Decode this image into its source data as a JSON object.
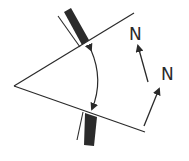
{
  "diagram": {
    "labels": {
      "north_1": "N",
      "north_2": "N"
    },
    "colors": {
      "stroke": "#2a2a2a",
      "bar_fill": "#2b2b2b",
      "background": "#ffffff"
    }
  }
}
